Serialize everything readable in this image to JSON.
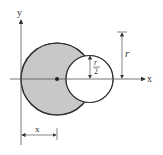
{
  "diagram": {
    "type": "geometry",
    "colors": {
      "shade": "#c8c8c8",
      "stroke": "#333333",
      "background": "#ffffff"
    },
    "axes": {
      "x_label": "x",
      "y_label": "y"
    },
    "dimensions": {
      "outer_radius_label": "r",
      "hole_radius_numerator": "r",
      "hole_radius_denominator": "2",
      "centroid_distance_label": "x"
    }
  }
}
